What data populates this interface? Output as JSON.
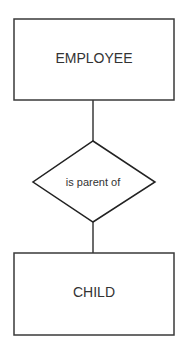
{
  "diagram": {
    "type": "er-diagram",
    "entities": [
      {
        "id": "employee",
        "label": "EMPLOYEE"
      },
      {
        "id": "child",
        "label": "CHILD"
      }
    ],
    "relationship": {
      "label": "is parent of",
      "from": "employee",
      "to": "child"
    },
    "colors": {
      "stroke": "#333333",
      "background": "#ffffff"
    }
  }
}
